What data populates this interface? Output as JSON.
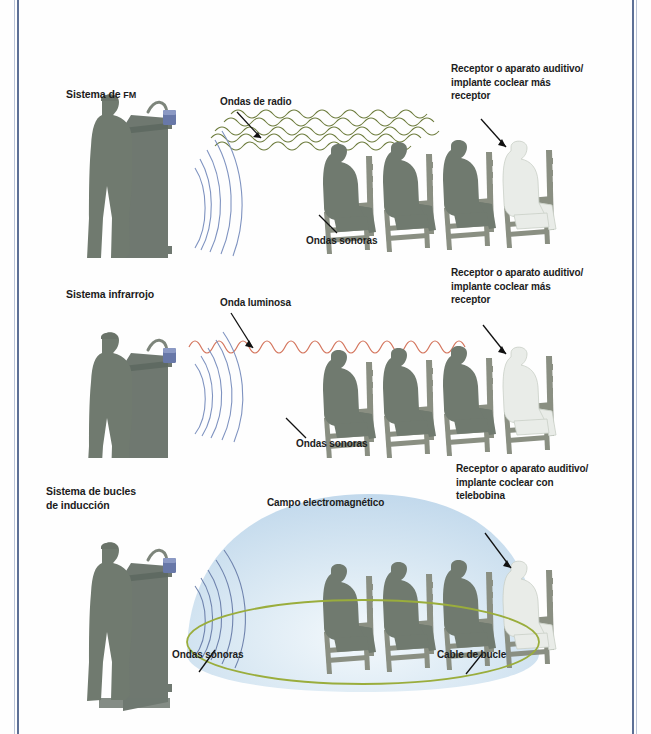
{
  "figure": {
    "page_border_color": "#5d7096",
    "background_color": "#fefefe"
  },
  "palette": {
    "person_dark": "#707a6f",
    "person_highlight": "#e9ece8",
    "chair": "#8a8f82",
    "podium": "#6f7870",
    "radio_wave": "#6b7a3a",
    "light_wave": "#d4765e",
    "sound_wave": "#7f93c0",
    "loop_cable": "#9aad3c",
    "em_field": "#cfe0ef",
    "text": "#1c1c1c",
    "leader_line": "#111111",
    "device_blue": "#6878a8"
  },
  "panels": [
    {
      "id": "fm",
      "system_label": "Sistema de ",
      "system_label_small": "FM",
      "labels": [
        {
          "name": "radio-waves-label",
          "text": "Ondas de radio"
        },
        {
          "name": "sound-waves-label",
          "text": "Ondas sonoras"
        },
        {
          "name": "receiver-label",
          "text": "Receptor o aparato auditivo/\nimplante coclear más\nreceptor"
        }
      ],
      "wave_kind": "radio",
      "audience_count": 4,
      "highlighted_seat_index": 3
    },
    {
      "id": "infrared",
      "system_label": "Sistema infrarrojo",
      "system_label_small": "",
      "labels": [
        {
          "name": "light-wave-label",
          "text": "Onda luminosa"
        },
        {
          "name": "sound-waves-label",
          "text": "Ondas sonoras"
        },
        {
          "name": "receiver-label",
          "text": "Receptor o aparato auditivo/\nimplante coclear más\nreceptor"
        }
      ],
      "wave_kind": "light",
      "audience_count": 4,
      "highlighted_seat_index": 3
    },
    {
      "id": "induction-loop",
      "system_label": "Sistema de bucles\nde inducción",
      "system_label_small": "",
      "labels": [
        {
          "name": "em-field-label",
          "text": "Campo electromagnético"
        },
        {
          "name": "sound-waves-label",
          "text": "Ondas sonoras"
        },
        {
          "name": "loop-cable-label",
          "text": "Cable de bucle"
        },
        {
          "name": "receiver-label",
          "text": "Receptor o aparato auditivo/\nimplante coclear con\ntelebobina"
        }
      ],
      "wave_kind": "electromagnetic",
      "audience_count": 4,
      "highlighted_seat_index": 3
    }
  ],
  "text": {
    "fm_system": "Sistema de ",
    "fm_small": "FM",
    "fm_radio_waves": "Ondas de radio",
    "fm_sound_waves": "Ondas sonoras",
    "fm_receiver": "Receptor o aparato auditivo/\nimplante coclear más\nreceptor",
    "ir_system": "Sistema infrarrojo",
    "ir_light_wave": "Onda luminosa",
    "ir_sound_waves": "Ondas sonoras",
    "ir_receiver": "Receptor o aparato auditivo/\nimplante coclear más\nreceptor",
    "loop_system": "Sistema de bucles\nde inducción",
    "loop_em_field": "Campo electromagnético",
    "loop_sound_waves": "Ondas sonoras",
    "loop_cable": "Cable de bucle",
    "loop_receiver": "Receptor o aparato auditivo/\nimplante coclear con\ntelebobina"
  }
}
